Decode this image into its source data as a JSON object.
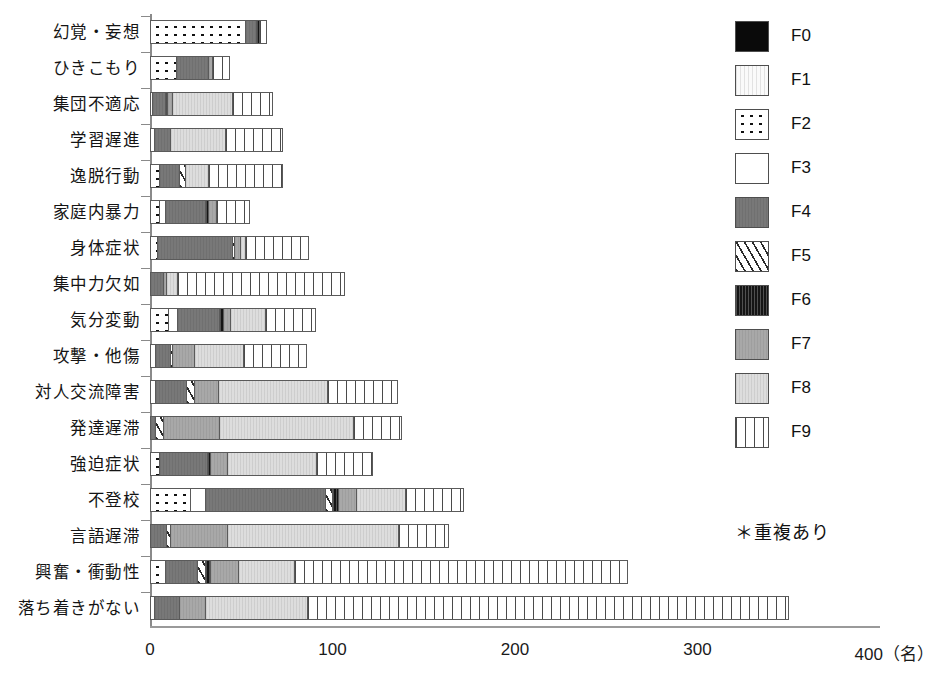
{
  "chart_data": {
    "type": "bar",
    "orientation": "horizontal",
    "stacked": true,
    "title": "",
    "xlabel": "400（名）",
    "ylabel": "",
    "xlim": [
      0,
      400
    ],
    "xticks": [
      0,
      100,
      200,
      300,
      400
    ],
    "xtick_labels": [
      "0",
      "100",
      "200",
      "300",
      "400（名）"
    ],
    "grid": false,
    "legend_position": "right",
    "note": "＊重複あり",
    "categories": [
      "幻覚・妄想",
      "ひきこもり",
      "集団不適応",
      "学習遅進",
      "逸脱行動",
      "家庭内暴力",
      "身体症状",
      "集中力欠如",
      "気分変動",
      "攻撃・他傷",
      "対人交流障害",
      "発達遅滞",
      "強迫症状",
      "不登校",
      "言語遅滞",
      "興奮・衝動性",
      "落ち着きがない"
    ],
    "series": [
      {
        "name": "F0",
        "values": [
          0,
          0,
          0,
          0,
          0,
          0,
          0,
          0,
          0,
          0,
          0,
          0,
          0,
          0,
          0,
          0,
          0
        ]
      },
      {
        "name": "F1",
        "values": [
          0,
          0,
          0,
          0,
          0,
          0,
          0,
          0,
          0,
          0,
          0,
          0,
          0,
          0,
          0,
          0,
          0
        ]
      },
      {
        "name": "F2",
        "values": [
          52,
          14,
          1,
          2,
          5,
          5,
          4,
          0,
          10,
          3,
          3,
          0,
          5,
          22,
          0,
          8,
          2
        ]
      },
      {
        "name": "F3",
        "values": [
          0,
          0,
          0,
          0,
          0,
          3,
          0,
          0,
          5,
          0,
          0,
          0,
          0,
          8,
          0,
          0,
          0
        ]
      },
      {
        "name": "F4",
        "values": [
          6,
          18,
          7,
          9,
          11,
          22,
          41,
          7,
          23,
          8,
          17,
          3,
          26,
          66,
          9,
          18,
          14
        ]
      },
      {
        "name": "F5",
        "values": [
          0,
          0,
          0,
          0,
          3,
          0,
          1,
          0,
          0,
          1,
          4,
          4,
          0,
          4,
          2,
          4,
          0
        ]
      },
      {
        "name": "F6",
        "values": [
          2,
          0,
          1,
          0,
          0,
          2,
          0,
          0,
          2,
          0,
          0,
          0,
          2,
          3,
          0,
          3,
          0
        ]
      },
      {
        "name": "F7",
        "values": [
          0,
          2,
          3,
          0,
          0,
          4,
          3,
          2,
          4,
          12,
          13,
          31,
          9,
          10,
          31,
          15,
          14
        ]
      },
      {
        "name": "F8",
        "values": [
          0,
          0,
          33,
          30,
          13,
          0,
          3,
          6,
          19,
          27,
          60,
          73,
          49,
          27,
          94,
          31,
          56
        ]
      },
      {
        "name": "F9",
        "values": [
          4,
          10,
          22,
          32,
          41,
          19,
          35,
          92,
          28,
          35,
          39,
          27,
          31,
          32,
          28,
          183,
          264
        ]
      }
    ],
    "legend_entries": [
      {
        "key": "F0",
        "label": "F0",
        "pattern": "solid-black"
      },
      {
        "key": "F1",
        "label": "F1",
        "pattern": "very-light-vertical-lines"
      },
      {
        "key": "F2",
        "label": "F2",
        "pattern": "dots"
      },
      {
        "key": "F3",
        "label": "F3",
        "pattern": "white"
      },
      {
        "key": "F4",
        "label": "F4",
        "pattern": "dark-gray"
      },
      {
        "key": "F5",
        "label": "F5",
        "pattern": "diagonal-hatch"
      },
      {
        "key": "F6",
        "label": "F6",
        "pattern": "black-vertical-lines"
      },
      {
        "key": "F7",
        "label": "F7",
        "pattern": "medium-gray"
      },
      {
        "key": "F8",
        "label": "F8",
        "pattern": "light-gray"
      },
      {
        "key": "F9",
        "label": "F9",
        "pattern": "vertical-lines"
      }
    ]
  }
}
